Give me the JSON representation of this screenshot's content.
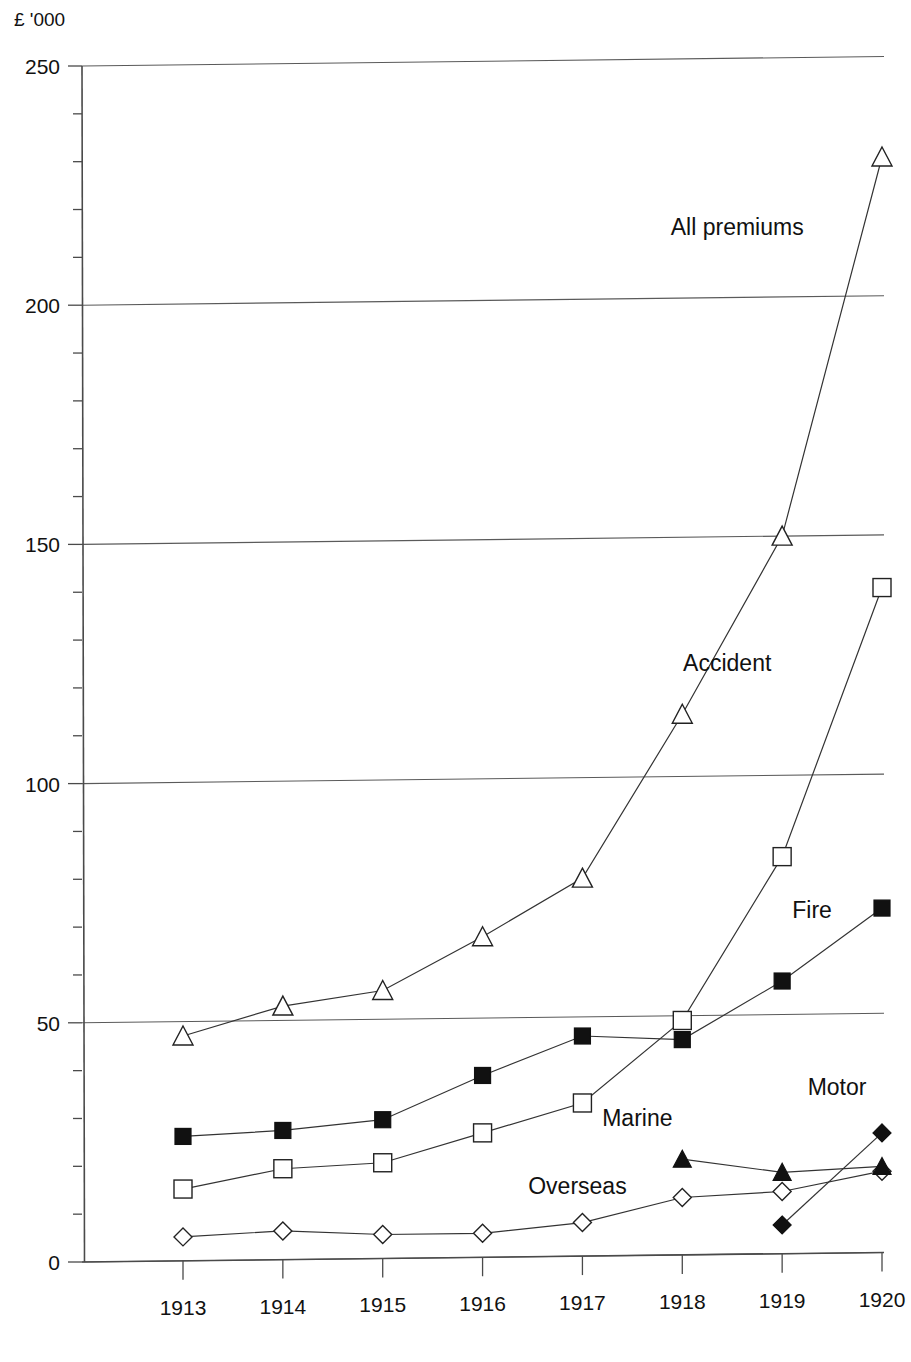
{
  "chart_data": {
    "type": "line",
    "title": "",
    "subtitle": "",
    "xlabel": "",
    "ylabel": "£ '000",
    "y_axis_unit_label": "£ '000",
    "categories": [
      "1913",
      "1914",
      "1915",
      "1916",
      "1917",
      "1918",
      "1919",
      "1920"
    ],
    "x": [
      1913,
      1914,
      1915,
      1916,
      1917,
      1918,
      1919,
      1920
    ],
    "ylim": [
      0,
      250
    ],
    "xlim": [
      1912.6,
      1920.4
    ],
    "ytick_labels": [
      "0",
      "50",
      "100",
      "150",
      "200",
      "250"
    ],
    "ytick_values": [
      0,
      50,
      100,
      150,
      200,
      250
    ],
    "yminor_step": 10,
    "xtick_labels": [
      "1913",
      "1914",
      "1915",
      "1916",
      "1917",
      "1918",
      "1919",
      "1920"
    ],
    "grid": true,
    "grid_axis": "y",
    "legend": "inline-labels",
    "legend_position": "inline",
    "series": [
      {
        "name": "All premiums",
        "marker": "open-triangle",
        "label_x": 1918.55,
        "label_y": 213,
        "values": [
          47,
          53,
          56,
          67,
          79,
          113,
          150,
          229
        ]
      },
      {
        "name": "Accident",
        "marker": "open-square",
        "label_x": 1918.45,
        "label_y": 122,
        "values": [
          15,
          19,
          20,
          26,
          32,
          49,
          83,
          139
        ]
      },
      {
        "name": "Fire",
        "marker": "filled-square",
        "label_x": 1919.3,
        "label_y": 70,
        "values": [
          26,
          27,
          29,
          38,
          46,
          45,
          57,
          72
        ]
      },
      {
        "name": "Overseas",
        "marker": "open-diamond",
        "label_x": 1916.95,
        "label_y": 13,
        "values": [
          5,
          6,
          5,
          5,
          7,
          12,
          13,
          17
        ]
      },
      {
        "name": "Marine",
        "marker": "filled-triangle",
        "label_x": 1917.55,
        "label_y": 27,
        "values": [
          null,
          null,
          null,
          null,
          null,
          20,
          17,
          18
        ]
      },
      {
        "name": "Motor",
        "marker": "filled-diamond",
        "label_x": 1919.55,
        "label_y": 33,
        "values": [
          null,
          null,
          null,
          null,
          null,
          null,
          6,
          25
        ]
      }
    ],
    "annotations": [
      {
        "text": "All premiums",
        "series": "All premiums"
      },
      {
        "text": "Accident",
        "series": "Accident"
      },
      {
        "text": "Fire",
        "series": "Fire"
      },
      {
        "text": "Overseas",
        "series": "Overseas"
      },
      {
        "text": "Marine",
        "series": "Marine"
      },
      {
        "text": "Motor",
        "series": "Motor"
      }
    ],
    "colors": {
      "line": "#333333",
      "grid": "#5a5a5a",
      "axis": "#4a4a4a",
      "text": "#111111",
      "background": "#ffffff"
    }
  }
}
